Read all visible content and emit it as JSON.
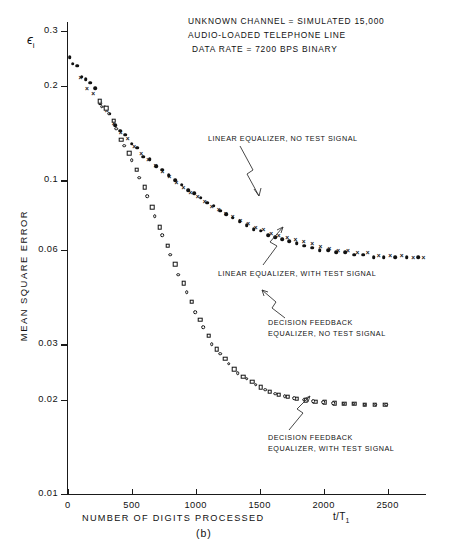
{
  "chart_data": {
    "type": "scatter",
    "title_lines": [
      "UNKNOWN CHANNEL = SIMULATED 15,000",
      "AUDIO-LOADED TELEPHONE LINE",
      "DATA RATE = 7200 BPS BINARY"
    ],
    "xlabel": "NUMBER OF DIGITS PROCESSED",
    "xlabel_unit": "t/T",
    "xlabel_unit_sub": "1",
    "ylabel": "MEAN SQUARE ERROR",
    "ylabel_symbol": "ϵ",
    "ylabel_symbol_sub": "i",
    "caption": "(b)",
    "yscale": "log",
    "ylim": [
      0.01,
      0.32
    ],
    "xlim": [
      0,
      2800
    ],
    "grid": false,
    "legend": "annotations",
    "yticks": [
      0.3,
      0.2,
      0.1,
      0.06,
      0.03,
      0.02,
      0.01
    ],
    "ytick_labels": [
      "0.3",
      "0.2",
      "0.1",
      "0.06",
      "0.03",
      "0.02",
      "0.01"
    ],
    "xticks": [
      0,
      500,
      1000,
      1500,
      2000,
      2500
    ],
    "xtick_labels": [
      "0",
      "500",
      "1000",
      "1500",
      "2000",
      "2500"
    ],
    "annotations": [
      {
        "name": "linear-equalizer-no-test-signal",
        "lines": [
          "LINEAR EQUALIZER, NO TEST SIGNAL"
        ],
        "marker": "filled-circle"
      },
      {
        "name": "linear-equalizer-with-test-signal",
        "lines": [
          "LINEAR EQUALIZER, WITH TEST SIGNAL"
        ],
        "marker": "cross"
      },
      {
        "name": "decision-feedback-equalizer-no-test-signal",
        "lines": [
          "DECISION FEEDBACK",
          "EQUALIZER, NO TEST SIGNAL"
        ],
        "marker": "open-square"
      },
      {
        "name": "decision-feedback-equalizer-with-test-signal",
        "lines": [
          "DECISION FEEDBACK",
          "EQUALIZER, WITH TEST SIGNAL"
        ],
        "marker": "open-circle"
      }
    ],
    "series": [
      {
        "name": "LINEAR EQUALIZER, NO TEST SIGNAL",
        "marker": "filled-circle",
        "points": [
          [
            15,
            0.247
          ],
          [
            40,
            0.236
          ],
          [
            75,
            0.232
          ],
          [
            110,
            0.214
          ],
          [
            140,
            0.21
          ],
          [
            175,
            0.205
          ],
          [
            215,
            0.197
          ],
          [
            255,
            0.176
          ],
          [
            290,
            0.172
          ],
          [
            330,
            0.163
          ],
          [
            370,
            0.15
          ],
          [
            410,
            0.144
          ],
          [
            450,
            0.14
          ],
          [
            500,
            0.131
          ],
          [
            545,
            0.127
          ],
          [
            590,
            0.119
          ],
          [
            640,
            0.117
          ],
          [
            690,
            0.111
          ],
          [
            740,
            0.108
          ],
          [
            790,
            0.104
          ],
          [
            840,
            0.1
          ],
          [
            890,
            0.097
          ],
          [
            940,
            0.093
          ],
          [
            990,
            0.091
          ],
          [
            1040,
            0.088
          ],
          [
            1090,
            0.085
          ],
          [
            1140,
            0.083
          ],
          [
            1190,
            0.08
          ],
          [
            1240,
            0.078
          ],
          [
            1290,
            0.076
          ],
          [
            1345,
            0.074
          ],
          [
            1400,
            0.072
          ],
          [
            1455,
            0.07
          ],
          [
            1510,
            0.069
          ],
          [
            1565,
            0.067
          ],
          [
            1620,
            0.066
          ],
          [
            1675,
            0.065
          ],
          [
            1730,
            0.064
          ],
          [
            1790,
            0.063
          ],
          [
            1850,
            0.062
          ],
          [
            1910,
            0.061
          ],
          [
            1970,
            0.06
          ],
          [
            2035,
            0.06
          ],
          [
            2100,
            0.059
          ],
          [
            2170,
            0.059
          ],
          [
            2240,
            0.058
          ],
          [
            2310,
            0.058
          ],
          [
            2390,
            0.057
          ],
          [
            2470,
            0.057
          ],
          [
            2560,
            0.057
          ],
          [
            2650,
            0.057
          ],
          [
            2740,
            0.057
          ]
        ]
      },
      {
        "name": "LINEAR EQUALIZER, WITH TEST SIGNAL",
        "marker": "cross",
        "points": [
          [
            100,
            0.213
          ],
          [
            150,
            0.197
          ],
          [
            200,
            0.19
          ],
          [
            255,
            0.18
          ],
          [
            305,
            0.168
          ],
          [
            360,
            0.152
          ],
          [
            415,
            0.143
          ],
          [
            470,
            0.137
          ],
          [
            520,
            0.129
          ],
          [
            575,
            0.122
          ],
          [
            630,
            0.117
          ],
          [
            685,
            0.112
          ],
          [
            740,
            0.107
          ],
          [
            795,
            0.103
          ],
          [
            850,
            0.099
          ],
          [
            905,
            0.095
          ],
          [
            960,
            0.092
          ],
          [
            1015,
            0.089
          ],
          [
            1070,
            0.086
          ],
          [
            1125,
            0.083
          ],
          [
            1180,
            0.081
          ],
          [
            1235,
            0.079
          ],
          [
            1290,
            0.077
          ],
          [
            1350,
            0.075
          ],
          [
            1410,
            0.073
          ],
          [
            1470,
            0.071
          ],
          [
            1530,
            0.07
          ],
          [
            1590,
            0.068
          ],
          [
            1650,
            0.067
          ],
          [
            1715,
            0.066
          ],
          [
            1780,
            0.065
          ],
          [
            1845,
            0.064
          ],
          [
            1910,
            0.063
          ],
          [
            1975,
            0.062
          ],
          [
            2045,
            0.061
          ],
          [
            2115,
            0.06
          ],
          [
            2190,
            0.06
          ],
          [
            2265,
            0.059
          ],
          [
            2345,
            0.059
          ],
          [
            2430,
            0.058
          ],
          [
            2520,
            0.058
          ],
          [
            2610,
            0.058
          ],
          [
            2700,
            0.057
          ],
          [
            2780,
            0.057
          ]
        ]
      },
      {
        "name": "DECISION FEEDBACK EQUALIZER, NO TEST SIGNAL",
        "marker": "open-square",
        "points": [
          [
            250,
            0.179
          ],
          [
            300,
            0.17
          ],
          [
            360,
            0.155
          ],
          [
            420,
            0.135
          ],
          [
            480,
            0.122
          ],
          [
            540,
            0.108
          ],
          [
            600,
            0.095
          ],
          [
            660,
            0.082
          ],
          [
            720,
            0.071
          ],
          [
            780,
            0.062
          ],
          [
            840,
            0.054
          ],
          [
            905,
            0.047
          ],
          [
            970,
            0.041
          ],
          [
            1035,
            0.036
          ],
          [
            1100,
            0.032
          ],
          [
            1165,
            0.029
          ],
          [
            1230,
            0.027
          ],
          [
            1300,
            0.025
          ],
          [
            1370,
            0.0237
          ],
          [
            1440,
            0.0228
          ],
          [
            1510,
            0.0219
          ],
          [
            1580,
            0.0212
          ],
          [
            1650,
            0.0207
          ],
          [
            1720,
            0.0204
          ],
          [
            1790,
            0.0201
          ],
          [
            1860,
            0.0199
          ],
          [
            1935,
            0.0197
          ],
          [
            2010,
            0.0196
          ],
          [
            2085,
            0.0195
          ],
          [
            2160,
            0.0194
          ],
          [
            2240,
            0.0194
          ],
          [
            2320,
            0.0193
          ],
          [
            2400,
            0.0193
          ],
          [
            2480,
            0.0193
          ]
        ]
      },
      {
        "name": "DECISION FEEDBACK EQUALIZER, WITH TEST SIGNAL",
        "marker": "open-circle",
        "points": [
          [
            265,
            0.172
          ],
          [
            320,
            0.163
          ],
          [
            380,
            0.146
          ],
          [
            440,
            0.129
          ],
          [
            500,
            0.116
          ],
          [
            560,
            0.102
          ],
          [
            620,
            0.089
          ],
          [
            680,
            0.077
          ],
          [
            740,
            0.067
          ],
          [
            800,
            0.058
          ],
          [
            865,
            0.05
          ],
          [
            930,
            0.044
          ],
          [
            995,
            0.038
          ],
          [
            1060,
            0.034
          ],
          [
            1125,
            0.03
          ],
          [
            1190,
            0.028
          ],
          [
            1260,
            0.026
          ],
          [
            1330,
            0.0243
          ],
          [
            1400,
            0.0233
          ],
          [
            1470,
            0.0223
          ],
          [
            1545,
            0.0215
          ],
          [
            1620,
            0.0209
          ],
          [
            1695,
            0.0205
          ],
          [
            1770,
            0.0202
          ],
          [
            1845,
            0.02
          ],
          [
            1920,
            0.0198
          ],
          [
            1995,
            0.0196
          ],
          [
            2075,
            0.0195
          ],
          [
            2155,
            0.0194
          ],
          [
            2235,
            0.0194
          ],
          [
            2320,
            0.0193
          ],
          [
            2405,
            0.0193
          ],
          [
            2490,
            0.0193
          ]
        ]
      }
    ]
  }
}
